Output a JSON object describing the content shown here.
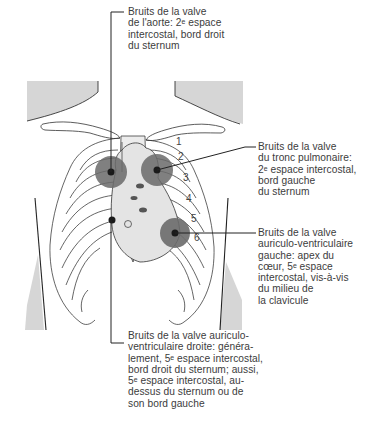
{
  "figure": {
    "colors": {
      "background": "#ffffff",
      "line": "#222222",
      "skin_shading": "#d6d6d6",
      "heart_fill": "#e4e4e4",
      "zone_fill": "#6a6a6a",
      "zone_dot": "#1a1a1a",
      "text": "#3c3c3c"
    },
    "rib_numbers": [
      "1",
      "2",
      "3",
      "4",
      "5",
      "6"
    ],
    "auscultation_points": [
      {
        "id": "aortic",
        "cx": 111,
        "cy": 172,
        "r": 16
      },
      {
        "id": "pulmonary",
        "cx": 157,
        "cy": 170,
        "r": 16
      },
      {
        "id": "mitral",
        "cx": 175,
        "cy": 233,
        "r": 15
      },
      {
        "id": "tricuspid",
        "cx": 112,
        "cy": 220,
        "r": 0
      }
    ]
  },
  "labels": {
    "aortic": "Bruits de la valve\nde l'aorte: 2ᵉ espace\nintercostal, bord droit\ndu sternum",
    "pulmonary": "Bruits de la valve\ndu tronc pulmonaire:\n2ᵉ espace intercostal,\nbord gauche\ndu sternum",
    "mitral": "Bruits de la valve\nauriculo-ventriculaire\ngauche: apex du\ncœur, 5ᵉ espace\nintercostal, vis-à-vis\ndu milieu de\nla clavicule",
    "tricuspid": "Bruits de la valve auriculo-\nventriculaire droite: généra-\nlement, 5ᵉ espace intercostal,\nbord droit du sternum; aussi,\n5ᵉ espace intercostal, au-\ndessus du sternum ou de\nson bord gauche"
  }
}
